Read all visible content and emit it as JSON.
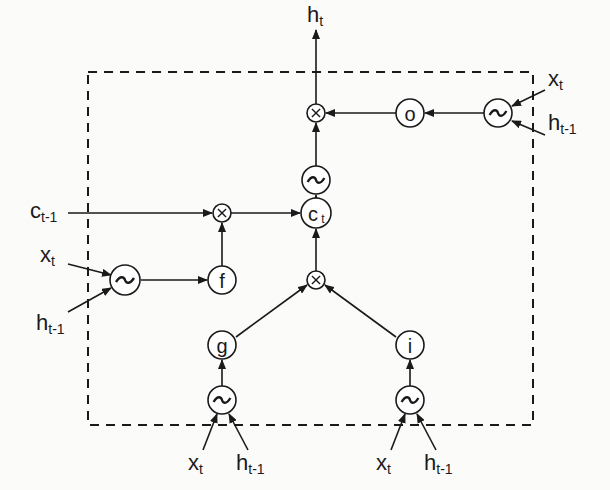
{
  "diagram": {
    "colors": {
      "stroke": "#1a1a1a",
      "background": "#fbfbfa"
    },
    "boundary": {
      "style": "dashed",
      "x": 88,
      "y": 72,
      "width": 445,
      "height": 353
    },
    "nodes": [
      {
        "id": "mul_out",
        "type": "multiply",
        "label": "⊗",
        "x": 316,
        "y": 113,
        "r": 9
      },
      {
        "id": "o",
        "type": "gate",
        "label": "o",
        "x": 410,
        "y": 113,
        "r": 14
      },
      {
        "id": "act_o",
        "type": "activation",
        "label": "~",
        "x": 498,
        "y": 113,
        "r": 14
      },
      {
        "id": "act_c",
        "type": "activation",
        "label": "~",
        "x": 316,
        "y": 180,
        "r": 14
      },
      {
        "id": "c_t",
        "type": "state",
        "label": "c",
        "sub": "t",
        "x": 316,
        "y": 213,
        "r": 15
      },
      {
        "id": "mul_f",
        "type": "multiply",
        "label": "⊗",
        "x": 222,
        "y": 213,
        "r": 9
      },
      {
        "id": "f",
        "type": "gate",
        "label": "f",
        "x": 222,
        "y": 280,
        "r": 14
      },
      {
        "id": "act_f",
        "type": "activation",
        "label": "~",
        "x": 125,
        "y": 280,
        "r": 15
      },
      {
        "id": "mul_in",
        "type": "multiply",
        "label": "⊗",
        "x": 316,
        "y": 280,
        "r": 9
      },
      {
        "id": "g",
        "type": "gate",
        "label": "g",
        "x": 222,
        "y": 345,
        "r": 14
      },
      {
        "id": "i",
        "type": "gate",
        "label": "i",
        "x": 410,
        "y": 345,
        "r": 14
      },
      {
        "id": "act_g",
        "type": "activation",
        "label": "~",
        "x": 222,
        "y": 400,
        "r": 14
      },
      {
        "id": "act_i",
        "type": "activation",
        "label": "~",
        "x": 410,
        "y": 400,
        "r": 14
      }
    ],
    "labels": [
      {
        "id": "h_t_out",
        "main": "h",
        "sub": "t",
        "x": 307,
        "y": 22
      },
      {
        "id": "x_t_o",
        "main": "x",
        "sub": "t",
        "x": 548,
        "y": 86
      },
      {
        "id": "h_tm1_o",
        "main": "h",
        "sub": "t-1",
        "x": 548,
        "y": 130
      },
      {
        "id": "c_tm1",
        "main": "c",
        "sub": "t-1",
        "x": 30,
        "y": 218
      },
      {
        "id": "x_t_f",
        "main": "x",
        "sub": "t",
        "x": 40,
        "y": 262
      },
      {
        "id": "h_tm1_f",
        "main": "h",
        "sub": "t-1",
        "x": 36,
        "y": 330
      },
      {
        "id": "x_t_g",
        "main": "x",
        "sub": "t",
        "x": 188,
        "y": 470
      },
      {
        "id": "h_tm1_g",
        "main": "h",
        "sub": "t-1",
        "x": 236,
        "y": 470
      },
      {
        "id": "x_t_i",
        "main": "x",
        "sub": "t",
        "x": 376,
        "y": 470
      },
      {
        "id": "h_tm1_i",
        "main": "h",
        "sub": "t-1",
        "x": 424,
        "y": 470
      }
    ],
    "edges": [
      {
        "from": [
          316,
          104
        ],
        "to": [
          316,
          30
        ]
      },
      {
        "from": [
          396,
          113
        ],
        "to": [
          326,
          113
        ]
      },
      {
        "from": [
          484,
          113
        ],
        "to": [
          425,
          113
        ]
      },
      {
        "from": [
          316,
          166
        ],
        "to": [
          316,
          123
        ]
      },
      {
        "from": [
          316,
          198
        ],
        "to": [
          316,
          195
        ]
      },
      {
        "from": [
          231,
          213
        ],
        "to": [
          300,
          213
        ]
      },
      {
        "from": [
          68,
          213
        ],
        "to": [
          212,
          213
        ]
      },
      {
        "from": [
          222,
          266
        ],
        "to": [
          222,
          223
        ]
      },
      {
        "from": [
          141,
          280
        ],
        "to": [
          207,
          280
        ]
      },
      {
        "from": [
          316,
          271
        ],
        "to": [
          316,
          229
        ]
      },
      {
        "from": [
          236,
          337
        ],
        "to": [
          307,
          285
        ]
      },
      {
        "from": [
          396,
          337
        ],
        "to": [
          325,
          285
        ]
      },
      {
        "from": [
          222,
          386
        ],
        "to": [
          222,
          360
        ]
      },
      {
        "from": [
          410,
          386
        ],
        "to": [
          410,
          360
        ]
      },
      {
        "from": [
          545,
          90
        ],
        "to": [
          512,
          106
        ]
      },
      {
        "from": [
          545,
          135
        ],
        "to": [
          512,
          121
        ]
      },
      {
        "from": [
          68,
          264
        ],
        "to": [
          111,
          275
        ]
      },
      {
        "from": [
          68,
          312
        ],
        "to": [
          111,
          288
        ]
      },
      {
        "from": [
          203,
          450
        ],
        "to": [
          217,
          414
        ]
      },
      {
        "from": [
          248,
          450
        ],
        "to": [
          229,
          414
        ]
      },
      {
        "from": [
          391,
          450
        ],
        "to": [
          405,
          414
        ]
      },
      {
        "from": [
          436,
          450
        ],
        "to": [
          417,
          414
        ]
      }
    ]
  }
}
